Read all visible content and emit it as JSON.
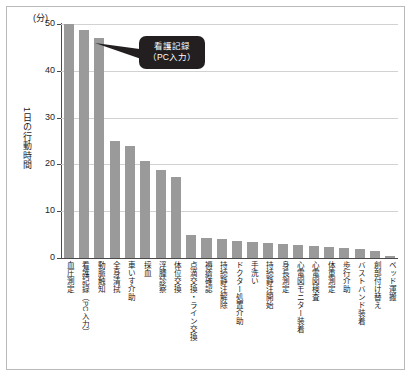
{
  "chart_data": {
    "type": "bar",
    "title": "",
    "subtitle": "",
    "unit_label": "(分)",
    "ylabel": "1日の行動時間",
    "xlabel": "",
    "ylim": [
      0,
      50
    ],
    "yticks": [
      0,
      10,
      20,
      30,
      40,
      50
    ],
    "ytick_labels": [
      "0",
      "10",
      "20",
      "30",
      "40",
      "50"
    ],
    "grid": true,
    "legend": "none",
    "bar_color": "#9a9a9a",
    "categories": [
      "血圧測定",
      "看護記録（PC入力）",
      "動脈触知",
      "全身清拭",
      "車いす介助",
      "採血",
      "浮腫診察",
      "体位交換",
      "点滴交換・ライン交換",
      "褥瘡確認",
      "持続静注解除",
      "ドクター処置介助",
      "手洗い",
      "持続静注開始",
      "身長測定",
      "心電図モニター装着",
      "心電図検査",
      "体重測定",
      "歩行介助",
      "バストバンド装着",
      "創部付け替え",
      "ベッド運搬"
    ],
    "values": [
      50.0,
      48.7,
      47.0,
      25.0,
      24.0,
      20.7,
      18.7,
      17.3,
      5.0,
      4.3,
      4.1,
      3.7,
      3.5,
      3.3,
      3.1,
      2.8,
      2.6,
      2.4,
      2.2,
      1.9,
      1.4,
      0.5
    ],
    "annotations": [
      {
        "name": "nursing-record-callout",
        "line1": "看護記録",
        "line2": "（PC入力）",
        "points_to_category": "看護記録（PC入力）",
        "background": "#231f20",
        "text_color": "#ffffff"
      }
    ]
  }
}
